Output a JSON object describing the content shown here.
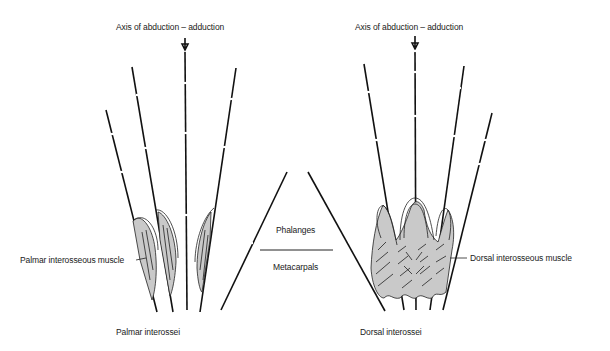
{
  "figure": {
    "left_panel": {
      "axis_label": "Axis of abduction – adduction",
      "muscle_label": "Palmar interosseous muscle",
      "caption": "Palmar interossei"
    },
    "right_panel": {
      "axis_label": "Axis of abduction – adduction",
      "muscle_label": "Dorsal interosseous muscle",
      "caption": "Dorsal interossei"
    },
    "legend": {
      "top_label": "Phalanges",
      "bottom_label": "Metacarpals"
    }
  }
}
